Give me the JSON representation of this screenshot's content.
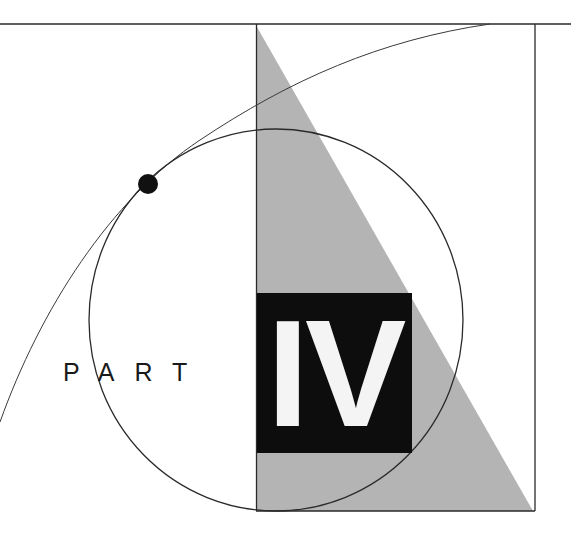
{
  "title": {
    "label": "PART",
    "numeral": "IV"
  },
  "colors": {
    "background": "#ffffff",
    "line": "#2a2a2a",
    "triangle_fill": "#b4b4b4",
    "box_fill": "#0d0d0d",
    "numeral_fill": "#f4f4f4",
    "dot_fill": "#111111"
  },
  "shapes": {
    "top_rule": "horizontal line across the top",
    "frame": "rectangle frame on the right",
    "triangle": "gray right triangle inside frame",
    "circle": "large circle outline",
    "arc": "sweeping curve tangent to circle",
    "dot": "black point of tangency"
  }
}
